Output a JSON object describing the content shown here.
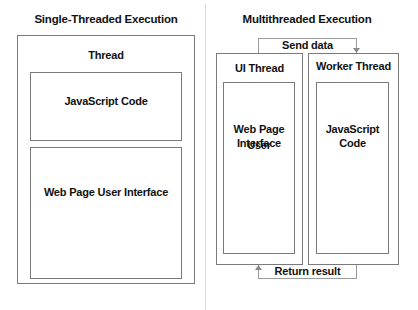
{
  "single": {
    "title": "Single-Threaded Execution",
    "thread_label": "Thread",
    "blocks": [
      {
        "label": "JavaScript Code"
      },
      {
        "label": "Web Page User Interface"
      }
    ]
  },
  "multi": {
    "title": "Multithreaded Execution",
    "ui_thread": {
      "label": "UI Thread",
      "content_line1": "Web Page User",
      "content_line2": "Interface"
    },
    "worker_thread": {
      "label": "Worker Thread",
      "content_line1": "JavaScript",
      "content_line2": "Code"
    },
    "send_label": "Send data",
    "return_label": "Return result"
  },
  "colors": {
    "border": "#7a7a7a",
    "divider": "#d8d8d8",
    "text": "#111111"
  }
}
